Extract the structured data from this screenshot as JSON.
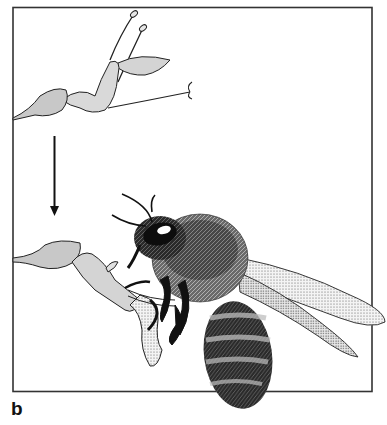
{
  "figure": {
    "panel_label": "b",
    "colors": {
      "frame": "#333333",
      "petal_fill": "#d4d4d4",
      "ink": "#111111",
      "background": "#ffffff"
    },
    "elements": {
      "top_flower": "flower-before-visit",
      "arrow": "down-arrow",
      "bottom_flower": "flower-during-visit",
      "insect": "bee"
    }
  }
}
